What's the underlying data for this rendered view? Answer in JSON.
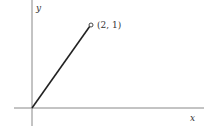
{
  "diagram": {
    "x_axis_label": "x",
    "y_axis_label": "y",
    "point_label": "(2, 1)",
    "point": {
      "x": 2,
      "y": 1
    },
    "origin": {
      "x": 0,
      "y": 0
    },
    "colors": {
      "axis": "#888888",
      "segment": "#222222",
      "text": "#333333"
    }
  }
}
